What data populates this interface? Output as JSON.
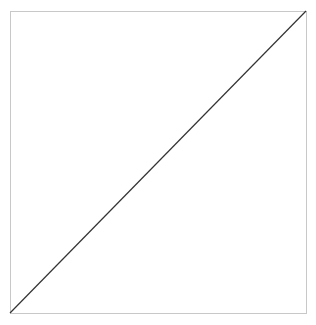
{
  "diagram": {
    "background_color": "#ffffff",
    "frame": {
      "x": 10,
      "y": 11,
      "width": 296,
      "height": 302,
      "stroke": "#c8c8c8",
      "stroke_width": 1
    },
    "diagonal": {
      "x1": 10,
      "y1": 313,
      "x2": 306,
      "y2": 11,
      "stroke": "#333333",
      "stroke_width": 1.2
    }
  }
}
